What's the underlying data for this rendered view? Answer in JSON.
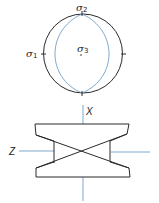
{
  "colors": {
    "outline": "#2a2a2a",
    "accent": "#6f9fc6",
    "background": "#ffffff"
  },
  "stereonet": {
    "labels": {
      "sigma1": {
        "symbol": "σ",
        "subscript": "1"
      },
      "sigma2": {
        "symbol": "σ",
        "subscript": "2"
      },
      "sigma3": {
        "symbol": "σ",
        "subscript": "3"
      }
    }
  },
  "block_diagram": {
    "axis_labels": {
      "x": "X",
      "z": "Z"
    }
  }
}
